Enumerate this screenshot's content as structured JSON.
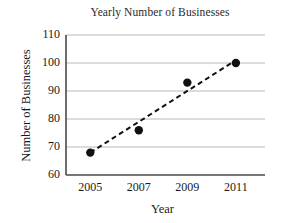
{
  "chart_data": {
    "type": "scatter",
    "title": "Yearly Number of Businesses",
    "xlabel": "Year",
    "ylabel": "Number of Businesses",
    "x": [
      2005,
      2007,
      2009,
      2011
    ],
    "values": [
      68,
      76,
      93,
      100
    ],
    "series": [
      {
        "name": "Number of Businesses",
        "values": [
          68,
          76,
          93,
          100
        ],
        "marker": "filled-circle",
        "marker_color": "#111111"
      },
      {
        "name": "Trend line",
        "type": "line",
        "style": "dashed",
        "color": "#111111",
        "endpoints": [
          {
            "x": 2005,
            "y": 68
          },
          {
            "x": 2011,
            "y": 101
          }
        ]
      }
    ],
    "xlim": [
      2004,
      2012.2
    ],
    "ylim": [
      60,
      110
    ],
    "xticks": [
      2005,
      2007,
      2009,
      2011
    ],
    "yticks": [
      60,
      70,
      80,
      90,
      100,
      110
    ],
    "xtick_labels": [
      "2005",
      "2007",
      "2009",
      "2011"
    ],
    "ytick_labels": [
      "60",
      "70",
      "80",
      "90",
      "100",
      "110"
    ],
    "grid": "horizontal",
    "grid_color": "#b8b8b8",
    "axis_color": "#4a4a4a",
    "background": "#ffffff",
    "legend": "none"
  }
}
